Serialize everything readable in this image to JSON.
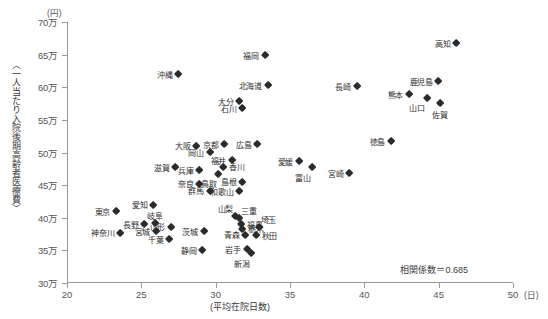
{
  "chart_data": {
    "type": "scatter",
    "title": "",
    "xlabel": "(平均在院日数)",
    "ylabel": "〈一人当たり入院後期高齢者医療費〉",
    "x_unit": "(日)",
    "y_unit": "(円)",
    "xlim": [
      20,
      50
    ],
    "ylim": [
      300000,
      700000
    ],
    "xticks": [
      "20",
      "25",
      "30",
      "35",
      "40",
      "45",
      "50"
    ],
    "xtick_values": [
      20,
      25,
      30,
      35,
      40,
      45,
      50
    ],
    "yticks": [
      "30万",
      "35万",
      "40万",
      "45万",
      "50万",
      "55万",
      "60万",
      "65万",
      "70万"
    ],
    "ytick_values": [
      300000,
      350000,
      400000,
      450000,
      500000,
      550000,
      600000,
      650000,
      700000
    ],
    "grid": false,
    "legend": "none",
    "annotation": "相関係数＝0.685",
    "correlation": 0.685,
    "points": [
      {
        "name": "高知",
        "x": 46.2,
        "y": 667000,
        "label_pos": "left"
      },
      {
        "name": "福岡",
        "x": 33.3,
        "y": 649000,
        "label_pos": "left"
      },
      {
        "name": "沖縄",
        "x": 27.5,
        "y": 620000,
        "label_pos": "left"
      },
      {
        "name": "鹿児島",
        "x": 45.0,
        "y": 609000,
        "label_pos": "left"
      },
      {
        "name": "北海道",
        "x": 33.5,
        "y": 603000,
        "label_pos": "left"
      },
      {
        "name": "長崎",
        "x": 39.5,
        "y": 601000,
        "label_pos": "left"
      },
      {
        "name": "熊本",
        "x": 43.0,
        "y": 589000,
        "label_pos": "left"
      },
      {
        "name": "大分",
        "x": 31.6,
        "y": 578000,
        "label_pos": "left"
      },
      {
        "name": "山口",
        "x": 44.2,
        "y": 583000,
        "label_pos": "bottom-left"
      },
      {
        "name": "佐賀",
        "x": 45.1,
        "y": 575000,
        "label_pos": "bottom-center"
      },
      {
        "name": "石川",
        "x": 31.8,
        "y": 568000,
        "label_pos": "left"
      },
      {
        "name": "徳島",
        "x": 41.8,
        "y": 517000,
        "label_pos": "left"
      },
      {
        "name": "京都",
        "x": 30.6,
        "y": 513000,
        "label_pos": "left"
      },
      {
        "name": "広島",
        "x": 32.8,
        "y": 512000,
        "label_pos": "left"
      },
      {
        "name": "大阪",
        "x": 28.7,
        "y": 510000,
        "label_pos": "left"
      },
      {
        "name": "岡山",
        "x": 29.6,
        "y": 500000,
        "label_pos": "left"
      },
      {
        "name": "福井",
        "x": 31.1,
        "y": 488000,
        "label_pos": "left"
      },
      {
        "name": "愛媛",
        "x": 35.6,
        "y": 486000,
        "label_pos": "left"
      },
      {
        "name": "宮崎",
        "x": 39.0,
        "y": 468000,
        "label_pos": "left"
      },
      {
        "name": "香川",
        "x": 30.5,
        "y": 478000,
        "label_pos": "right"
      },
      {
        "name": "滋賀",
        "x": 27.3,
        "y": 477000,
        "label_pos": "left"
      },
      {
        "name": "兵庫",
        "x": 28.9,
        "y": 473000,
        "label_pos": "left"
      },
      {
        "name": "富山",
        "x": 36.5,
        "y": 477000,
        "label_pos": "bottom-left"
      },
      {
        "name": "鳥取",
        "x": 30.2,
        "y": 467000,
        "label_pos": "bottom-left"
      },
      {
        "name": "島根",
        "x": 31.8,
        "y": 455000,
        "label_pos": "left"
      },
      {
        "name": "奈良",
        "x": 28.9,
        "y": 452000,
        "label_pos": "left"
      },
      {
        "name": "群馬",
        "x": 29.6,
        "y": 441000,
        "label_pos": "left"
      },
      {
        "name": "和歌山",
        "x": 31.6,
        "y": 440000,
        "label_pos": "left"
      },
      {
        "name": "愛知",
        "x": 25.8,
        "y": 420000,
        "label_pos": "left"
      },
      {
        "name": "東京",
        "x": 23.3,
        "y": 410000,
        "label_pos": "left"
      },
      {
        "name": "山梨",
        "x": 31.3,
        "y": 402000,
        "label_pos": "top-left"
      },
      {
        "name": "三重",
        "x": 31.6,
        "y": 399000,
        "label_pos": "top-right"
      },
      {
        "name": "岐阜",
        "x": 25.9,
        "y": 391000,
        "label_pos": "top-center"
      },
      {
        "name": "長野",
        "x": 25.2,
        "y": 390000,
        "label_pos": "left"
      },
      {
        "name": "福島",
        "x": 31.7,
        "y": 390000,
        "label_pos": "right"
      },
      {
        "name": "埼玉",
        "x": 32.9,
        "y": 386000,
        "label_pos": "top-right"
      },
      {
        "name": "栃木",
        "x": 31.8,
        "y": 383000,
        "label_pos": "right"
      },
      {
        "name": "山形",
        "x": 27.0,
        "y": 386000,
        "label_pos": "left"
      },
      {
        "name": "宮城",
        "x": 26.0,
        "y": 379000,
        "label_pos": "left"
      },
      {
        "name": "茨城",
        "x": 29.2,
        "y": 379000,
        "label_pos": "left"
      },
      {
        "name": "神奈川",
        "x": 23.6,
        "y": 377000,
        "label_pos": "left"
      },
      {
        "name": "青森",
        "x": 32.0,
        "y": 374000,
        "label_pos": "left"
      },
      {
        "name": "秋田",
        "x": 32.7,
        "y": 373000,
        "label_pos": "right"
      },
      {
        "name": "千葉",
        "x": 26.9,
        "y": 367000,
        "label_pos": "left"
      },
      {
        "name": "静岡",
        "x": 29.1,
        "y": 350000,
        "label_pos": "left"
      },
      {
        "name": "岩手",
        "x": 32.1,
        "y": 352000,
        "label_pos": "left"
      },
      {
        "name": "新潟",
        "x": 32.4,
        "y": 345000,
        "label_pos": "bottom-left"
      }
    ]
  },
  "footnote": ""
}
